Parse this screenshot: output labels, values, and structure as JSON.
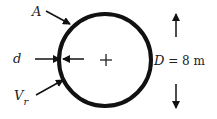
{
  "diagram": {
    "labels": {
      "area": "A",
      "thickness": "d",
      "volume_main": "V",
      "volume_sub": "r",
      "diameter_var": "D",
      "diameter_eq": " = 8 m"
    },
    "colors": {
      "stroke": "#111111",
      "text": "#222222"
    }
  }
}
